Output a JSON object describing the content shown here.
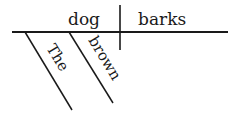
{
  "diagram": {
    "type": "sentence-diagram",
    "sentence": "The brown dog barks",
    "subject": "dog",
    "predicate": "barks",
    "modifiers": [
      {
        "word": "The",
        "modifies": "dog"
      },
      {
        "word": "brown",
        "modifies": "dog"
      }
    ],
    "colors": {
      "ink": "#1a1a1a",
      "background": "#ffffff"
    }
  }
}
